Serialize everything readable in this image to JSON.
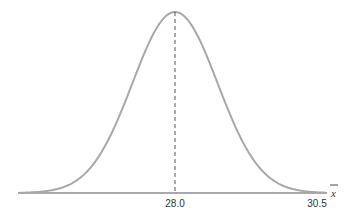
{
  "chart_data": {
    "type": "line",
    "title": "",
    "xlabel": "x̄",
    "ylabel": "",
    "mean": 28.0,
    "sd": 0.75,
    "tick_labels": [
      "28.0",
      "30.5"
    ],
    "tick_values": [
      28.0,
      30.5
    ],
    "mean_line": "dashed",
    "grid": false,
    "legend": null,
    "colors": {
      "curve": "#a8a8a8",
      "axis": "#555555",
      "mean_line": "#555555"
    }
  },
  "labels": {
    "tick_mean": "28.0",
    "tick_right": "30.5",
    "axis_var": "x"
  }
}
